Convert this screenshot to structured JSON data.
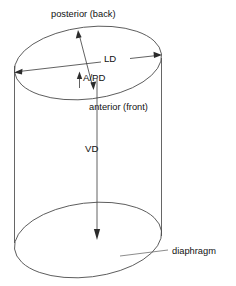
{
  "figure": {
    "type": "anatomical-cylinder-diagram",
    "background_color": "#ffffff",
    "line_color": "#4a4a4a",
    "text_color": "#111111",
    "fill_color": "#d9d9d9"
  },
  "labels": {
    "posterior": "posterior (back)",
    "anterior": "anterior (front)",
    "lateral_diameter": "LD",
    "anteroposterior_diameter": "A/PD",
    "vertical_diameter": "VD",
    "diaphragm": "diaphragm"
  },
  "geometry": {
    "top_ellipse": {
      "cx": 88,
      "cy": 63,
      "rx": 74,
      "ry": 36,
      "rotation_deg": -7
    },
    "bottom_ellipse": {
      "cx": 88,
      "cy": 240,
      "rx": 74,
      "ry": 37,
      "rotation_deg": -7
    },
    "left_wall_x": 14,
    "right_wall_x": 162,
    "wall_top_y": 63,
    "wall_bottom_y": 240
  },
  "measurements": [
    {
      "name": "LD",
      "from": [
        15,
        72
      ],
      "to": [
        160,
        55
      ],
      "style": "double-arrow"
    },
    {
      "name": "A/PD",
      "from": [
        78,
        31
      ],
      "to": [
        93,
        89
      ],
      "style": "double-arrow"
    },
    {
      "name": "VD",
      "from": [
        97,
        78
      ],
      "to": [
        97,
        240
      ],
      "style": "single-arrow-down"
    }
  ]
}
